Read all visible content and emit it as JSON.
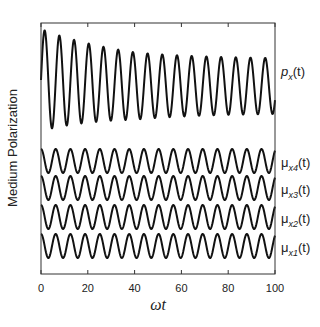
{
  "chart_data": {
    "type": "line",
    "title": "",
    "xlabel": "ωt",
    "ylabel": "Medium Polarization",
    "xlim": [
      0,
      100
    ],
    "xticks": [
      0,
      20,
      40,
      60,
      80,
      100
    ],
    "xtick_labels": [
      "0",
      "20",
      "40",
      "60",
      "80",
      "100"
    ],
    "yticks": [],
    "grid": false,
    "legend_position": "right-inline",
    "series": [
      {
        "name": "p_x(t)",
        "label_main": "p",
        "label_sub": "x",
        "label_tail": "(t)",
        "description": "large-amplitude oscillation decaying from ~1.0 to ~0.55 relative amplitude, ~16 periods over 0-100",
        "center_px": 86,
        "amp_start_px": 51,
        "amp_end_px": 27,
        "period": 6.28
      },
      {
        "name": "μ_x4(t)",
        "label_main": "μ",
        "label_sub": "x4",
        "label_tail": "(t)",
        "description": "constant-amplitude sinusoid, ~16 periods",
        "center_px": 161,
        "amp_px": 12,
        "period": 6.28
      },
      {
        "name": "μ_x3(t)",
        "label_main": "μ",
        "label_sub": "x3",
        "label_tail": "(t)",
        "description": "constant-amplitude sinusoid, ~16 periods",
        "center_px": 188,
        "amp_px": 12,
        "period": 6.28
      },
      {
        "name": "μ_x2(t)",
        "label_main": "μ",
        "label_sub": "x2",
        "label_tail": "(t)",
        "description": "constant-amplitude sinusoid, ~16 periods",
        "center_px": 217,
        "amp_px": 12,
        "period": 6.28
      },
      {
        "name": "μ_x1(t)",
        "label_main": "μ",
        "label_sub": "x1",
        "label_tail": "(t)",
        "description": "constant-amplitude sinusoid, ~16 periods",
        "center_px": 246,
        "amp_px": 12,
        "period": 6.28
      }
    ]
  },
  "labels": {
    "ylabel": "Medium Polarization",
    "xlabel": "ωt"
  }
}
